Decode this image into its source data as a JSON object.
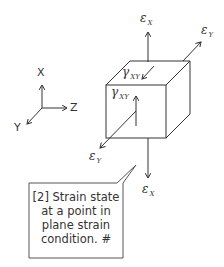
{
  "diagram": {
    "coordinate_axes": {
      "x_label": "X",
      "y_label": "Y",
      "z_label": "Z"
    },
    "strain_labels": {
      "eps_x_top": {
        "symbol": "ε",
        "sub": "X"
      },
      "eps_y_top": {
        "symbol": "ε",
        "sub": "Y"
      },
      "gamma_top": {
        "symbol": "γ",
        "sub": "XY"
      },
      "gamma_front": {
        "symbol": "γ",
        "sub": "XY"
      },
      "eps_y_bottom": {
        "symbol": "ε",
        "sub": "Y"
      },
      "eps_x_bottom": {
        "symbol": "ε",
        "sub": "X"
      }
    },
    "callout": {
      "lines": [
        "[2] Strain state",
        "at a point in",
        "plane strain",
        "condition. #"
      ]
    },
    "colors": {
      "line": "#333333",
      "background": "#ffffff"
    }
  }
}
